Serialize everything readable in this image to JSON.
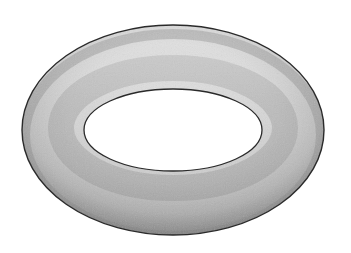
{
  "image": {
    "subject": "torus",
    "description": "Grayscale shaded 3D torus (donut shape) viewed at an oblique angle on a white background",
    "colors": {
      "background": "#ffffff",
      "surface_light": "#e6e6e6",
      "surface_mid": "#bdbdbd",
      "surface_dark": "#8a8a8a",
      "outline": "#2a2a2a",
      "hole": "#ffffff"
    },
    "geometry": {
      "outer": {
        "cx": 173,
        "cy": 130,
        "rx": 151,
        "ry": 105
      },
      "inner": {
        "cx": 173,
        "cy": 130,
        "rx": 89,
        "ry": 41
      }
    }
  }
}
